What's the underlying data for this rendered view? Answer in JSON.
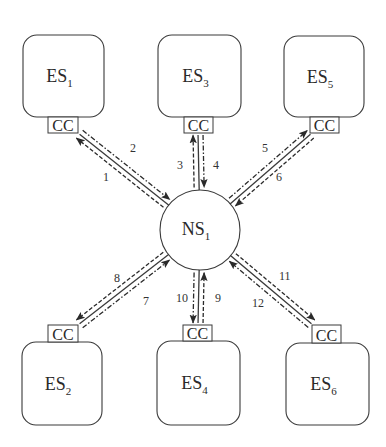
{
  "diagram": {
    "type": "star-topology",
    "colors": {
      "stroke": "#3a3a3a",
      "text": "#2a2a2a",
      "background": "#ffffff"
    },
    "center": {
      "id": "NS1",
      "label": "NS",
      "sub": "1",
      "cx": 200,
      "cy": 230,
      "r": 40
    },
    "stations": [
      {
        "id": "ES1",
        "label": "ES",
        "sub": "1",
        "box": [
          23,
          35,
          81,
          82
        ],
        "cc": [
          48,
          117,
          30,
          16
        ],
        "cc_side": "bottom"
      },
      {
        "id": "ES3",
        "label": "ES",
        "sub": "3",
        "box": [
          158,
          35,
          83,
          82
        ],
        "cc": [
          184,
          117,
          29,
          16
        ],
        "cc_side": "bottom"
      },
      {
        "id": "ES5",
        "label": "ES",
        "sub": "5",
        "box": [
          284,
          36,
          80,
          81
        ],
        "cc": [
          310,
          117,
          29,
          16
        ],
        "cc_side": "bottom"
      },
      {
        "id": "ES2",
        "label": "ES",
        "sub": "2",
        "box": [
          22,
          342,
          80,
          83
        ],
        "cc": [
          48,
          325,
          30,
          17
        ],
        "cc_side": "top"
      },
      {
        "id": "ES4",
        "label": "ES",
        "sub": "4",
        "box": [
          157,
          341,
          83,
          84
        ],
        "cc": [
          183,
          325,
          29,
          16
        ],
        "cc_side": "top"
      },
      {
        "id": "ES6",
        "label": "ES",
        "sub": "6",
        "box": [
          286,
          343,
          83,
          82
        ],
        "cc": [
          312,
          325,
          29,
          18
        ],
        "cc_side": "top"
      }
    ],
    "cc_label": "CC",
    "links": [
      {
        "station": "ES1",
        "anchor": [
          78,
          133
        ],
        "messages": [
          {
            "num": "1",
            "direction": "to-center",
            "offset": -5,
            "style": "dashdot",
            "label_pos": [
              103,
              181
            ]
          },
          {
            "num": "2",
            "direction": "to-station",
            "offset": 5,
            "style": "dash",
            "label_pos": [
              130,
              152
            ]
          }
        ]
      },
      {
        "station": "ES3",
        "anchor": [
          198,
          133
        ],
        "messages": [
          {
            "num": "3",
            "direction": "to-center",
            "offset": -5,
            "style": "dashdot",
            "label_pos": [
              177,
              169
            ]
          },
          {
            "num": "4",
            "direction": "to-station",
            "offset": 5,
            "style": "dash",
            "label_pos": [
              213,
              169
            ]
          }
        ]
      },
      {
        "station": "ES5",
        "anchor": [
          312,
          133
        ],
        "messages": [
          {
            "num": "5",
            "direction": "to-center",
            "offset": -5,
            "style": "dash",
            "label_pos": [
              262,
              152
            ]
          },
          {
            "num": "6",
            "direction": "to-station",
            "offset": 5,
            "style": "dashdot",
            "label_pos": [
              276,
              181
            ]
          }
        ]
      },
      {
        "station": "ES2",
        "anchor": [
          78,
          325
        ],
        "messages": [
          {
            "num": "7",
            "direction": "to-center",
            "offset": 5,
            "style": "dashdot",
            "label_pos": [
              143,
              305
            ]
          },
          {
            "num": "8",
            "direction": "to-station",
            "offset": -5,
            "style": "dash",
            "label_pos": [
              114,
              282
            ]
          }
        ]
      },
      {
        "station": "ES4",
        "anchor": [
          198,
          325
        ],
        "messages": [
          {
            "num": "9",
            "direction": "to-center",
            "offset": 5,
            "style": "dash",
            "label_pos": [
              215,
              302
            ]
          },
          {
            "num": "10",
            "direction": "to-station",
            "offset": -5,
            "style": "dashdot",
            "label_pos": [
              176,
              302
            ]
          }
        ]
      },
      {
        "station": "ES6",
        "anchor": [
          313,
          325
        ],
        "messages": [
          {
            "num": "11",
            "direction": "to-center",
            "offset": -5,
            "style": "dashdot",
            "label_pos": [
              279,
              280
            ]
          },
          {
            "num": "12",
            "direction": "to-station",
            "offset": 5,
            "style": "dash",
            "label_pos": [
              252,
              307
            ]
          }
        ]
      }
    ]
  }
}
